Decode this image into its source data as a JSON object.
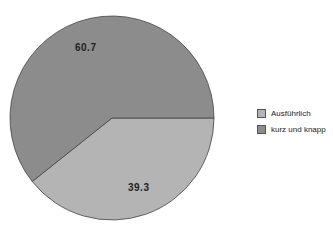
{
  "chart_data": {
    "type": "pie",
    "title": "",
    "categories": [
      "Ausführlich",
      "kurz und knapp"
    ],
    "values": [
      39.3,
      60.7
    ],
    "colors": [
      "#b4b4b4",
      "#8c8c8c"
    ],
    "labels": [
      "39.3",
      "60.7"
    ],
    "legend_position": "right",
    "start_angle_deg": 90,
    "direction": "clockwise"
  },
  "legend": {
    "items": [
      {
        "label": "Ausführlich",
        "color": "#b4b4b4"
      },
      {
        "label": "kurz und knapp",
        "color": "#8c8c8c"
      }
    ]
  }
}
